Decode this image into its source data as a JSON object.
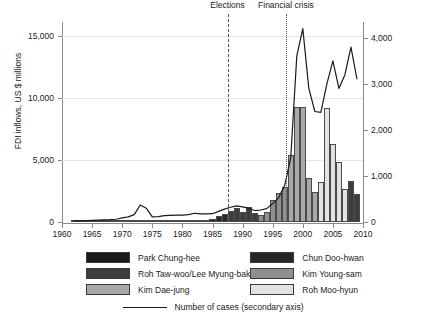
{
  "chart_data": {
    "type": "bar",
    "title": "",
    "xlabel": "",
    "ylabel": "FDI inflows, US $ millions",
    "y2label": "",
    "xlim": [
      1960,
      2010
    ],
    "ylim": [
      0,
      16000
    ],
    "y2lim": [
      0,
      4300
    ],
    "grid": true,
    "legend_position": "below",
    "y_ticks": [
      "0",
      "5,000",
      "10,000",
      "15,000"
    ],
    "y_tick_values": [
      0,
      5000,
      10000,
      15000
    ],
    "y2_ticks": [
      "0",
      "1,000",
      "2,000",
      "3,000",
      "4,000"
    ],
    "y2_tick_values": [
      0,
      1000,
      2000,
      3000,
      4000
    ],
    "x_ticks": [
      "1960",
      "1965",
      "1970",
      "1975",
      "1980",
      "1985",
      "1990",
      "1995",
      "2000",
      "2005",
      "2010"
    ],
    "x_tick_values": [
      1960,
      1965,
      1970,
      1975,
      1980,
      1985,
      1990,
      1995,
      2000,
      2005,
      2010
    ],
    "x": [
      1962,
      1963,
      1964,
      1965,
      1966,
      1967,
      1968,
      1969,
      1970,
      1971,
      1972,
      1973,
      1974,
      1975,
      1976,
      1977,
      1978,
      1979,
      1980,
      1981,
      1982,
      1983,
      1984,
      1985,
      1986,
      1987,
      1988,
      1989,
      1990,
      1991,
      1992,
      1993,
      1994,
      1995,
      1996,
      1997,
      1998,
      1999,
      2000,
      2001,
      2002,
      2003,
      2004,
      2005,
      2006,
      2007,
      2008,
      2009
    ],
    "values": [
      10,
      20,
      20,
      20,
      30,
      30,
      30,
      40,
      60,
      50,
      70,
      150,
      200,
      80,
      100,
      110,
      120,
      130,
      100,
      110,
      120,
      130,
      140,
      230,
      480,
      620,
      900,
      1100,
      800,
      1200,
      730,
      590,
      810,
      1780,
      2330,
      2840,
      5410,
      9330,
      9280,
      3530,
      2390,
      3220,
      9250,
      6310,
      4880,
      2630,
      3310,
      2250
    ],
    "series": [
      {
        "name": "Number of cases (secondary axis)",
        "axis": "secondary",
        "type": "line",
        "x": [
          1962,
          1963,
          1964,
          1965,
          1966,
          1967,
          1968,
          1969,
          1970,
          1971,
          1972,
          1973,
          1974,
          1975,
          1976,
          1977,
          1978,
          1979,
          1980,
          1981,
          1982,
          1983,
          1984,
          1985,
          1986,
          1987,
          1988,
          1989,
          1990,
          1991,
          1992,
          1993,
          1994,
          1995,
          1996,
          1997,
          1998,
          1999,
          2000,
          2001,
          2002,
          2003,
          2004,
          2005,
          2006,
          2007,
          2008,
          2009
        ],
        "values": [
          25,
          30,
          30,
          35,
          40,
          45,
          50,
          60,
          90,
          110,
          160,
          370,
          300,
          110,
          115,
          140,
          145,
          150,
          150,
          160,
          190,
          175,
          175,
          180,
          230,
          280,
          320,
          350,
          330,
          300,
          250,
          260,
          290,
          400,
          530,
          800,
          1400,
          3600,
          4200,
          2900,
          2400,
          2380,
          3000,
          3500,
          2900,
          3200,
          3800,
          3100
        ]
      }
    ],
    "bar_groups": [
      {
        "key": "park_chung_hee",
        "label": "Park Chung-hee",
        "color": "#1a1a1a",
        "years": [
          1962,
          1963,
          1964,
          1965,
          1966,
          1967,
          1968,
          1969,
          1970,
          1971,
          1972,
          1973,
          1974,
          1975,
          1976,
          1977,
          1978,
          1979
        ]
      },
      {
        "key": "chun_doo_hwan",
        "label": "Chun Doo-hwan",
        "color": "#262626",
        "years": [
          1980,
          1981,
          1982,
          1983,
          1984,
          1985,
          1986,
          1987
        ]
      },
      {
        "key": "roh_tae_woo_lee_myung_bak",
        "label": "Roh Taw-woo/Lee Myung-bak",
        "color": "#3d3d3d",
        "years": [
          1988,
          1989,
          1990,
          1991,
          1992,
          2008,
          2009
        ]
      },
      {
        "key": "kim_young_sam",
        "label": "Kim Young-sam",
        "color": "#8f8f8f",
        "years": [
          1993,
          1994,
          1995,
          1996,
          1997
        ]
      },
      {
        "key": "kim_dae_jung",
        "label": "Kim Dae-jung",
        "color": "#a8a8a8",
        "years": [
          1998,
          1999,
          2000,
          2001,
          2002
        ]
      },
      {
        "key": "roh_moo_hyun",
        "label": "Roh Moo-hyun",
        "color": "#e2e2e2",
        "years": [
          2003,
          2004,
          2005,
          2006,
          2007
        ]
      }
    ],
    "annotations": [
      {
        "key": "elections",
        "label": "Elections",
        "x": 1987.5,
        "style": "dashed"
      },
      {
        "key": "financial_crisis",
        "label": "Financial crisis",
        "x": 1997.2,
        "style": "dotted"
      }
    ]
  },
  "legend": {
    "items": [
      {
        "label": "Park Chung-hee",
        "color": "#1a1a1a"
      },
      {
        "label": "Chun Doo-hwan",
        "color": "#262626"
      },
      {
        "label": "Roh Taw-woo/Lee Myung-bak",
        "color": "#3d3d3d"
      },
      {
        "label": "Kim Young-sam",
        "color": "#8f8f8f"
      },
      {
        "label": "Kim Dae-jung",
        "color": "#a8a8a8"
      },
      {
        "label": "Roh Moo-hyun",
        "color": "#e2e2e2"
      }
    ],
    "line_label": "Number of cases (secondary axis)"
  },
  "colors": {
    "line": "#1a1a1a",
    "axis": "#8a8a8a",
    "grid": "#e6e6e6",
    "text": "#1a1a1a",
    "background": "#ffffff"
  }
}
